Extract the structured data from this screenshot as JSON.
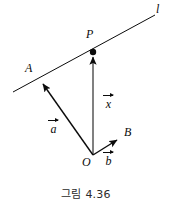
{
  "figure": {
    "caption": "그림 4.36",
    "stroke_color": "#0b0b0b",
    "background_color": "#ffffff",
    "points": [
      {
        "id": "P",
        "label": "P",
        "x": 93,
        "y": 52,
        "marked": true
      },
      {
        "id": "A",
        "label": "A",
        "x": 40,
        "y": 80,
        "marked": false
      },
      {
        "id": "O",
        "label": "O",
        "x": 93,
        "y": 155,
        "marked": false
      },
      {
        "id": "B",
        "label": "B",
        "x": 120,
        "y": 138,
        "marked": false
      }
    ],
    "line": {
      "label": "l",
      "from_x": 13,
      "from_y": 92,
      "to_x": 155,
      "to_y": 15
    },
    "vectors": [
      {
        "id": "x",
        "label": "x",
        "from": "O",
        "to": "P",
        "label_x": 104,
        "label_y": 96
      },
      {
        "id": "a",
        "label": "a",
        "from": "O",
        "to": "A",
        "label_x": 48,
        "label_y": 120
      },
      {
        "id": "b",
        "label": "b",
        "from": "O",
        "to": "B",
        "label_x": 104,
        "label_y": 152
      }
    ],
    "point_labels": {
      "P": {
        "text": "P",
        "x": 86,
        "y": 30
      },
      "A": {
        "text": "A",
        "x": 26,
        "y": 64
      },
      "O": {
        "text": "O",
        "x": 85,
        "y": 158
      },
      "B": {
        "text": "B",
        "x": 125,
        "y": 127
      },
      "l": {
        "text": "l",
        "x": 157,
        "y": 5
      }
    }
  }
}
